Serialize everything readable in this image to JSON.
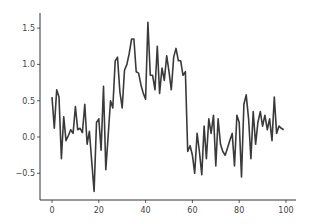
{
  "chart_data": {
    "type": "line",
    "title": "",
    "xlabel": "",
    "ylabel": "",
    "xlim": [
      -4,
      104
    ],
    "ylim": [
      -0.85,
      1.7
    ],
    "grid": false,
    "legend": null,
    "xticks": [
      0,
      20,
      40,
      60,
      80,
      100
    ],
    "xtick_labels": [
      "0",
      "20",
      "40",
      "60",
      "80",
      "100"
    ],
    "yticks": [
      -0.5,
      0.0,
      0.5,
      1.0,
      1.5
    ],
    "ytick_labels": [
      "−0.5",
      "0.0",
      "0.5",
      "1.0",
      "1.5"
    ],
    "line_color": "#3a3a3a",
    "series": [
      {
        "name": "series",
        "x": [
          0,
          1,
          2,
          3,
          4,
          5,
          6,
          7,
          8,
          9,
          10,
          11,
          12,
          13,
          14,
          15,
          16,
          17,
          18,
          19,
          20,
          21,
          22,
          23,
          24,
          25,
          26,
          27,
          28,
          29,
          30,
          31,
          32,
          33,
          34,
          35,
          36,
          37,
          38,
          39,
          40,
          41,
          42,
          43,
          44,
          45,
          46,
          47,
          48,
          49,
          50,
          51,
          52,
          53,
          54,
          55,
          56,
          57,
          58,
          59,
          60,
          61,
          62,
          63,
          64,
          65,
          66,
          67,
          68,
          69,
          70,
          71,
          72,
          73,
          74,
          75,
          76,
          77,
          78,
          79,
          80,
          81,
          82,
          83,
          84,
          85,
          86,
          87,
          88,
          89,
          90,
          91,
          92,
          93,
          94,
          95,
          96,
          97,
          98,
          99
        ],
        "values": [
          0.55,
          0.12,
          0.65,
          0.55,
          -0.3,
          0.28,
          -0.05,
          0.02,
          0.1,
          0.05,
          0.42,
          0.1,
          0.12,
          0.06,
          0.45,
          -0.1,
          0.08,
          -0.35,
          -0.75,
          0.2,
          0.25,
          -0.18,
          0.7,
          -0.45,
          0.02,
          0.5,
          0.4,
          1.05,
          1.1,
          0.62,
          0.4,
          0.92,
          1.0,
          1.15,
          1.35,
          1.35,
          0.9,
          0.88,
          0.72,
          0.6,
          0.52,
          1.58,
          0.85,
          0.85,
          0.65,
          1.25,
          0.6,
          0.95,
          0.78,
          1.12,
          0.9,
          0.65,
          1.1,
          1.22,
          1.05,
          1.05,
          0.85,
          0.9,
          -0.2,
          -0.12,
          -0.25,
          -0.5,
          0.05,
          -0.2,
          -0.52,
          0.15,
          -0.3,
          0.25,
          0.05,
          0.3,
          -0.4,
          0.25,
          -0.1,
          -0.2,
          -0.25,
          -0.15,
          -0.05,
          0.05,
          -0.4,
          0.3,
          0.2,
          -0.55,
          0.45,
          0.58,
          0.25,
          -0.3,
          0.35,
          -0.1,
          0.2,
          0.35,
          0.15,
          0.3,
          0.1,
          0.25,
          -0.05,
          0.55,
          0.05,
          0.15,
          0.12,
          0.1
        ]
      }
    ]
  }
}
